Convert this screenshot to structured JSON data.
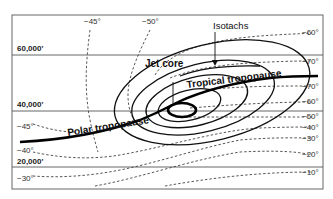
{
  "diagram": {
    "altitudes": [
      {
        "label": "60,000'"
      },
      {
        "label": "40,000'"
      },
      {
        "label": "20,000'"
      }
    ],
    "labels": {
      "isotachs": "Isotachs",
      "jet_core": "Jet core",
      "tropical_tropopause": "Tropical tropopause",
      "polar_tropopause": "Polar tropopause"
    },
    "top_temperatures": [
      "−45°",
      "−50°"
    ],
    "left_temperatures": [
      "−45°",
      "−40°",
      "−30°"
    ],
    "right_temperatures": [
      "−60°",
      "−70°",
      "−70°",
      "−60°",
      "−50°",
      "−40°",
      "−30°",
      "−20°",
      "−10°"
    ],
    "colors": {
      "line": "#000000",
      "dashed": "#444444",
      "frame": "#666666",
      "background": "#ffffff"
    }
  }
}
